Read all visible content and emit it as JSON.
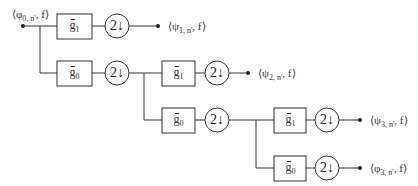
{
  "diagram": {
    "type": "wavelet-packet-filter-bank",
    "input": {
      "label_prefix": "⟨φ",
      "label_sub": "0, n'",
      "label_suffix": ", f⟩"
    },
    "outputs": [
      {
        "label_prefix": "⟨ψ",
        "label_sub": "1, n'",
        "label_suffix": ", f⟩"
      },
      {
        "label_prefix": "⟨ψ",
        "label_sub": "2, n'",
        "label_suffix": ", f⟩"
      },
      {
        "label_prefix": "⟨ψ",
        "label_sub": "3, n'",
        "label_suffix": ", f⟩"
      },
      {
        "label_prefix": "⟨φ",
        "label_sub": "3, n'",
        "label_suffix": ", f⟩"
      }
    ],
    "filters": [
      {
        "name": "g",
        "sub": "1",
        "stage": 1
      },
      {
        "name": "g",
        "sub": "0",
        "stage": 1
      },
      {
        "name": "g",
        "sub": "1",
        "stage": 2
      },
      {
        "name": "g",
        "sub": "0",
        "stage": 2
      },
      {
        "name": "g",
        "sub": "1",
        "stage": 3
      },
      {
        "name": "g",
        "sub": "0",
        "stage": 3
      }
    ],
    "downsampler": {
      "factor": "2",
      "arrow": "↓"
    }
  }
}
